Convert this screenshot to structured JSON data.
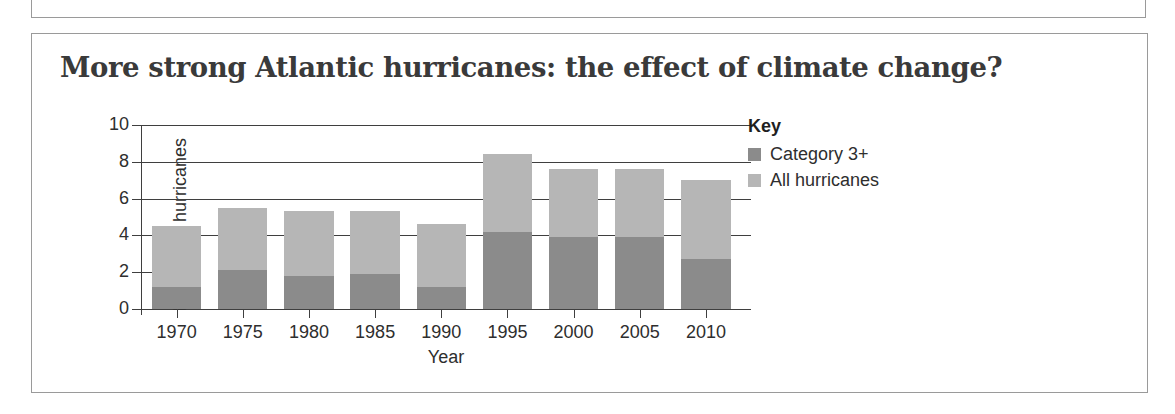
{
  "figure": {
    "title": "More strong Atlantic hurricanes: the effect of climate change?"
  },
  "legend": {
    "title": "Key",
    "entries": [
      {
        "label": "Category 3+",
        "color": "#8b8b8b"
      },
      {
        "label": "All hurricanes",
        "color": "#b6b6b6"
      }
    ]
  },
  "chart_data": {
    "type": "bar",
    "stacked": false,
    "overlay": true,
    "title": "More strong Atlantic hurricanes: the effect of climate change?",
    "xlabel": "Year",
    "ylabel": "Number of hurricanes",
    "categories": [
      "1970",
      "1975",
      "1980",
      "1985",
      "1990",
      "1995",
      "2000",
      "2005",
      "2010"
    ],
    "series": [
      {
        "name": "All hurricanes",
        "color": "#b6b6b6",
        "values": [
          4.5,
          5.5,
          5.3,
          5.3,
          4.6,
          8.4,
          7.6,
          7.6,
          7.0
        ]
      },
      {
        "name": "Category 3+",
        "color": "#8b8b8b",
        "values": [
          1.2,
          2.1,
          1.8,
          1.9,
          1.2,
          4.2,
          3.9,
          3.9,
          2.7
        ]
      }
    ],
    "ylim": [
      0,
      10
    ],
    "yticks": [
      "0",
      "2",
      "4",
      "6",
      "8",
      "10"
    ],
    "ytick_values": [
      0,
      2,
      4,
      6,
      8,
      10
    ],
    "gridlines_full": [
      4,
      6,
      8,
      10
    ],
    "gridlines_short": [
      0,
      2
    ],
    "grid": true,
    "legend_position": "right"
  }
}
